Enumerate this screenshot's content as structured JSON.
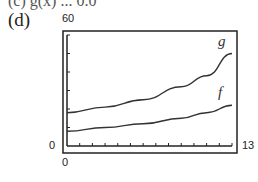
{
  "header": {
    "cutoff_text": "(c) g(x) ... 0.0",
    "panel_label": "(d)"
  },
  "chart_data": {
    "type": "line",
    "title": "",
    "xlabel": "",
    "ylabel": "",
    "xlim": [
      0,
      13
    ],
    "ylim": [
      0,
      60
    ],
    "tick_labels": {
      "xmin": "0",
      "xmax": "13",
      "ymin": "0",
      "ymax": "60"
    },
    "grid": false,
    "x_tick_count": 13,
    "y_tick_count": 6,
    "series": [
      {
        "name": "g",
        "x": [
          0,
          3,
          6,
          9,
          11,
          13
        ],
        "values": [
          18,
          21,
          25,
          32,
          38,
          50
        ]
      },
      {
        "name": "f",
        "x": [
          0,
          3,
          6,
          9,
          11,
          13
        ],
        "values": [
          8,
          10,
          12,
          15,
          18,
          22
        ]
      }
    ],
    "legend": "inline curve labels"
  }
}
